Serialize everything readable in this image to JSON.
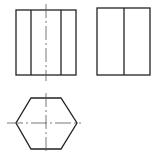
{
  "diagram": {
    "title": "",
    "type": "orthographic-projection",
    "colors": {
      "line": "#222222",
      "centerline": "#444444",
      "background": "#ffffff"
    },
    "views": [
      {
        "name": "front-view",
        "outline": [
          16,
          10,
          60,
          65
        ],
        "inner_lines_x": [
          31,
          61
        ],
        "centerline_x": 46
      },
      {
        "name": "side-view",
        "outline": [
          97,
          8,
          53,
          67
        ],
        "inner_lines_x": [
          124
        ]
      },
      {
        "name": "top-view",
        "shape": "hexagon",
        "center": [
          46,
          123
        ],
        "vertices": [
          [
            31,
            98
          ],
          [
            61,
            98
          ],
          [
            77,
            123
          ],
          [
            61,
            149
          ],
          [
            31,
            149
          ],
          [
            16,
            123
          ]
        ]
      }
    ]
  }
}
